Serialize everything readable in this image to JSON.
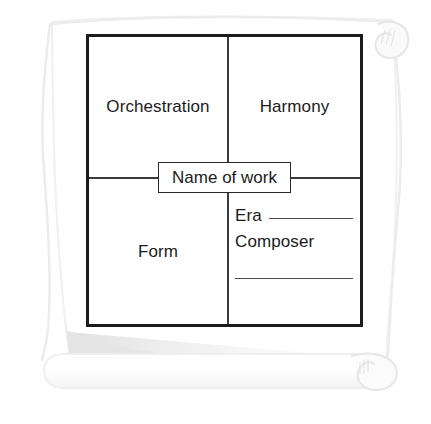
{
  "page": {
    "background_color": "#ffffff",
    "paper_color": "#ffffff",
    "paper_edge_color": "#efefef",
    "shadow_color": "#e8e8e8",
    "ink_color": "#1b1b1b",
    "rule_color": "#4a4a4a"
  },
  "organizer": {
    "title_box": {
      "label": "Name of work"
    },
    "quadrants": [
      {
        "id": "top-left",
        "label": "Orchestration"
      },
      {
        "id": "top-right",
        "label": "Harmony"
      },
      {
        "id": "bottom-left",
        "label": "Form"
      }
    ],
    "bottom_right": {
      "fields": [
        {
          "label": "Era",
          "value": "",
          "has_rule": true
        },
        {
          "label": "Composer",
          "value": "",
          "has_rule": false
        }
      ],
      "extra_rule": true
    }
  },
  "decorations": {
    "scroll_curl_top_right": "scroll-curl-icon",
    "scroll_curl_bottom_right": "scroll-curl-icon",
    "scroll_roll_bottom": "scroll-roll-icon"
  }
}
